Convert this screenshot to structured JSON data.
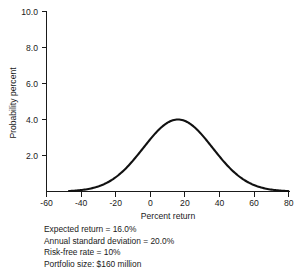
{
  "chart_data": {
    "type": "line",
    "title": "",
    "subtitle": "",
    "xlabel": "Percent return",
    "ylabel": "Probability percent",
    "xlim": [
      -60,
      80
    ],
    "ylim": [
      0,
      10
    ],
    "grid": false,
    "legend": null,
    "xticks": [
      "-60",
      "-40",
      "-20",
      "0",
      "20",
      "40",
      "60",
      "80"
    ],
    "xtick_values": [
      -60,
      -40,
      -20,
      0,
      20,
      40,
      60,
      80
    ],
    "yticks": [
      "2.0",
      "4.0",
      "6.0",
      "8.0",
      "10.0"
    ],
    "ytick_values": [
      2.0,
      4.0,
      6.0,
      8.0,
      10.0
    ],
    "series": [
      {
        "name": "Probability distribution of portfolio return",
        "distribution": "normal",
        "mean": 16.0,
        "std_dev": 20.0,
        "peak_value": 4.0,
        "x": [
          -46,
          -40,
          -34,
          -28,
          -22,
          -16,
          -10,
          -4,
          2,
          8,
          14,
          16,
          20,
          26,
          32,
          38,
          44,
          50,
          56,
          62,
          68,
          74,
          78
        ],
        "values": [
          0.03,
          0.07,
          0.14,
          0.26,
          0.45,
          0.73,
          1.12,
          1.6,
          2.15,
          2.7,
          3.2,
          3.95,
          3.85,
          3.3,
          2.6,
          1.85,
          1.2,
          0.7,
          0.37,
          0.18,
          0.08,
          0.03,
          0.01
        ]
      }
    ],
    "annotations": [
      "Expected return  =  16.0%",
      "Annual standard deviation  =  20.0%",
      "Risk-free rate  =  10%",
      "Portfolio size: $160 million"
    ]
  },
  "notes": {
    "line1": "Expected return  =  16.0%",
    "line2": "Annual standard deviation  =  20.0%",
    "line3": "Risk-free rate  =  10%",
    "line4": "Portfolio size: $160 million"
  },
  "axes": {
    "x_title": "Percent return",
    "y_title": "Probability percent",
    "x_tick_labels": [
      "-60",
      "-40",
      "-20",
      "0",
      "20",
      "40",
      "60",
      "80"
    ],
    "y_tick_labels": [
      "10.0",
      "8.0",
      "6.0",
      "4.0",
      "2.0"
    ]
  },
  "colors": {
    "curve": "#111111",
    "axis": "#1a1a1a",
    "background": "#ffffff",
    "text": "#1a1a1a"
  }
}
